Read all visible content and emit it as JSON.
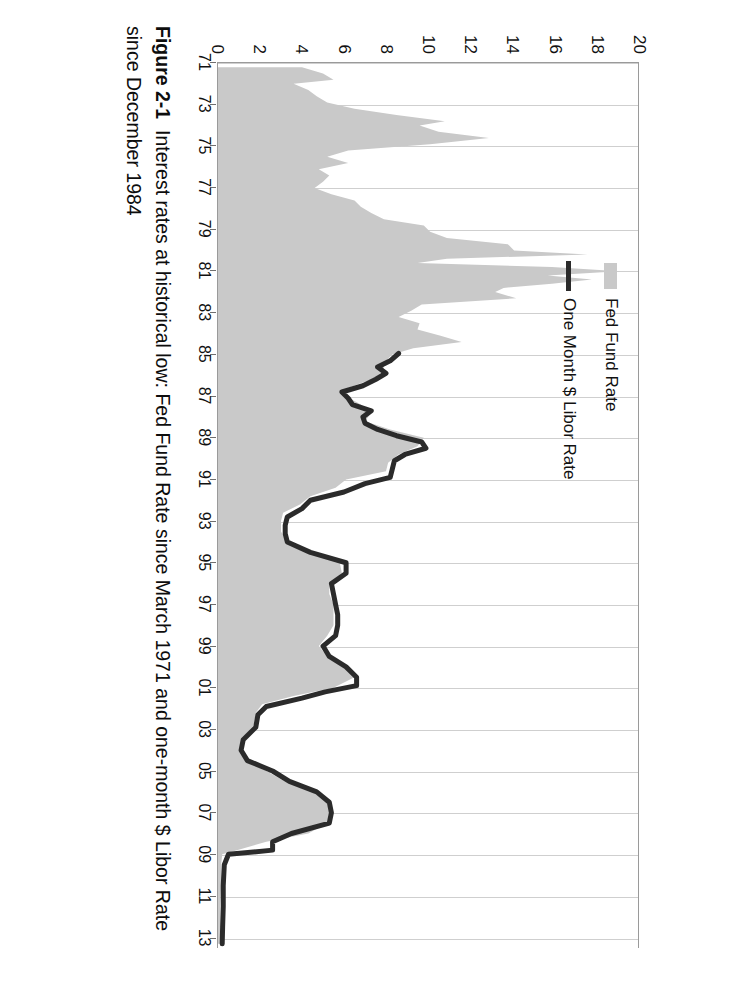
{
  "figure": {
    "caption_number": "Figure 2-1",
    "caption_text": "Interest rates at historical low: Fed Fund Rate since March 1971 and one-month $ Libor Rate since December 1984"
  },
  "legend": {
    "position": "top-left-inside",
    "items": [
      {
        "label": "Fed Fund Rate",
        "marker": "area-swatch",
        "color": "#c9c9c9"
      },
      {
        "label": "One Month $ Libor Rate",
        "marker": "line-swatch",
        "color": "#2b2b2b"
      }
    ]
  },
  "colors": {
    "area_fill": "#c9c9c9",
    "line": "#2b2b2b",
    "gridline": "#cfcfcf",
    "axis": "#9a9a9a",
    "text": "#111111",
    "background": "#ffffff"
  },
  "chart_data": {
    "type": "area",
    "title": "",
    "xlabel": "",
    "ylabel": "",
    "ylim": [
      0,
      20
    ],
    "ytick_values": [
      0,
      2,
      4,
      6,
      8,
      10,
      12,
      14,
      16,
      18,
      20
    ],
    "ytick_labels": [
      "0",
      "2",
      "4",
      "6",
      "8",
      "10",
      "12",
      "14",
      "16",
      "18",
      "20"
    ],
    "xlim": [
      1971,
      2013.5
    ],
    "xtick_values": [
      1971,
      1973,
      1975,
      1977,
      1979,
      1981,
      1983,
      1985,
      1987,
      1989,
      1991,
      1993,
      1995,
      1997,
      1999,
      2001,
      2003,
      2005,
      2007,
      2009,
      2011,
      2013
    ],
    "xtick_labels": [
      "71",
      "73",
      "75",
      "77",
      "79",
      "81",
      "83",
      "85",
      "87",
      "89",
      "91",
      "93",
      "95",
      "97",
      "99",
      "01",
      "03",
      "05",
      "07",
      "09",
      "11",
      "13"
    ],
    "grid": "vertical",
    "rotation_note": "figure printed rotated 90 degrees on the page",
    "series": [
      {
        "name": "Fed Fund Rate",
        "render": "area",
        "color": "#c9c9c9",
        "x": [
          1971.2,
          1971.5,
          1971.8,
          1972.0,
          1972.3,
          1972.6,
          1972.9,
          1973.2,
          1973.5,
          1973.8,
          1974.0,
          1974.3,
          1974.6,
          1974.9,
          1975.2,
          1975.5,
          1975.8,
          1976.1,
          1976.4,
          1976.7,
          1977.0,
          1977.3,
          1977.6,
          1977.9,
          1978.2,
          1978.5,
          1978.8,
          1979.1,
          1979.4,
          1979.7,
          1980.0,
          1980.2,
          1980.4,
          1980.6,
          1980.8,
          1981.0,
          1981.2,
          1981.4,
          1981.6,
          1981.8,
          1982.0,
          1982.3,
          1982.6,
          1982.9,
          1983.2,
          1983.5,
          1983.8,
          1984.1,
          1984.4,
          1984.7,
          1985.0,
          1985.4,
          1985.8,
          1986.2,
          1986.6,
          1987.0,
          1987.4,
          1987.8,
          1988.2,
          1988.6,
          1989.0,
          1989.4,
          1989.8,
          1990.2,
          1990.6,
          1991.0,
          1991.4,
          1991.8,
          1992.2,
          1992.6,
          1993.0,
          1993.5,
          1994.0,
          1994.5,
          1995.0,
          1995.5,
          1996.0,
          1996.5,
          1997.0,
          1997.5,
          1998.0,
          1998.5,
          1999.0,
          1999.5,
          2000.0,
          2000.5,
          2001.0,
          2001.4,
          2001.8,
          2002.2,
          2002.8,
          2003.4,
          2004.0,
          2004.5,
          2005.0,
          2005.5,
          2006.0,
          2006.5,
          2007.0,
          2007.5,
          2008.0,
          2008.4,
          2008.8,
          2009.0,
          2009.5,
          2010.5,
          2011.5,
          2012.5,
          2013.3
        ],
        "y": [
          4.0,
          5.0,
          5.5,
          3.6,
          4.3,
          4.7,
          5.2,
          6.5,
          8.5,
          10.8,
          9.6,
          10.5,
          12.9,
          10.1,
          6.2,
          5.2,
          6.2,
          4.8,
          5.3,
          5.0,
          4.6,
          5.4,
          6.5,
          6.8,
          7.3,
          7.9,
          9.8,
          10.1,
          10.9,
          13.8,
          14.1,
          17.6,
          10.9,
          9.5,
          15.9,
          19.1,
          15.7,
          17.8,
          15.9,
          13.6,
          13.2,
          14.2,
          9.7,
          9.2,
          8.6,
          9.6,
          9.5,
          10.6,
          11.6,
          9.3,
          8.3,
          7.9,
          7.9,
          7.3,
          6.2,
          6.1,
          6.8,
          7.3,
          7.0,
          8.2,
          9.8,
          9.5,
          8.6,
          8.1,
          8.0,
          6.1,
          5.6,
          4.4,
          3.9,
          3.1,
          3.0,
          3.0,
          3.3,
          4.5,
          5.8,
          5.9,
          5.3,
          5.3,
          5.5,
          5.5,
          5.5,
          5.2,
          4.8,
          5.2,
          6.0,
          6.5,
          5.5,
          3.6,
          2.1,
          1.8,
          1.7,
          1.2,
          1.0,
          1.3,
          2.3,
          3.2,
          4.5,
          5.2,
          5.3,
          5.2,
          4.3,
          2.3,
          0.9,
          0.2,
          0.15,
          0.15,
          0.1,
          0.1,
          0.1
        ]
      },
      {
        "name": "One Month $ Libor Rate",
        "render": "line",
        "color": "#2b2b2b",
        "starts": "1984-12",
        "x": [
          1984.95,
          1985.3,
          1985.6,
          1985.9,
          1986.2,
          1986.5,
          1986.8,
          1987.1,
          1987.4,
          1987.7,
          1988.0,
          1988.3,
          1988.6,
          1988.9,
          1989.2,
          1989.5,
          1989.8,
          1990.1,
          1990.5,
          1990.9,
          1991.2,
          1991.6,
          1992.0,
          1992.4,
          1992.8,
          1993.2,
          1993.6,
          1994.0,
          1994.5,
          1995.0,
          1995.5,
          1996.0,
          1996.5,
          1997.0,
          1997.5,
          1998.0,
          1998.5,
          1999.0,
          1999.5,
          2000.0,
          2000.5,
          2000.9,
          2001.2,
          2001.5,
          2001.9,
          2002.3,
          2002.9,
          2003.5,
          2004.0,
          2004.5,
          2005.0,
          2005.5,
          2006.0,
          2006.5,
          2007.0,
          2007.5,
          2008.0,
          2008.4,
          2008.8,
          2009.0,
          2009.5,
          2010.5,
          2011.5,
          2012.5,
          2013.3
        ],
        "y": [
          8.6,
          8.2,
          7.6,
          8.0,
          7.5,
          6.9,
          5.9,
          6.2,
          6.4,
          7.3,
          6.9,
          7.0,
          7.6,
          8.5,
          9.7,
          9.9,
          8.9,
          8.4,
          8.3,
          8.2,
          7.0,
          6.0,
          4.4,
          4.0,
          3.3,
          3.2,
          3.2,
          3.3,
          4.4,
          6.1,
          6.1,
          5.4,
          5.5,
          5.6,
          5.7,
          5.7,
          5.6,
          5.0,
          5.3,
          6.1,
          6.6,
          6.6,
          5.1,
          4.0,
          2.3,
          1.9,
          1.8,
          1.2,
          1.1,
          1.4,
          2.6,
          3.4,
          4.7,
          5.3,
          5.4,
          5.3,
          3.5,
          2.6,
          2.6,
          0.5,
          0.3,
          0.25,
          0.25,
          0.22,
          0.2
        ]
      }
    ]
  }
}
